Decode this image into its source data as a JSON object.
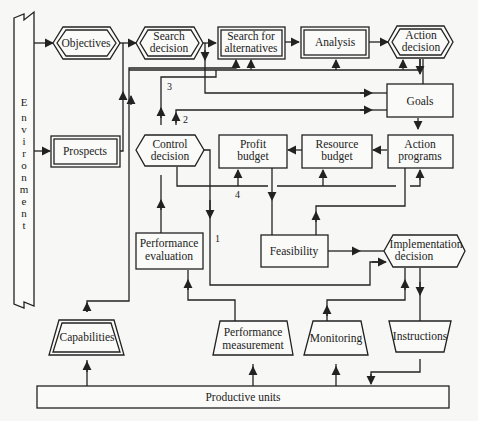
{
  "diagram": {
    "type": "flowchart",
    "environment": {
      "label": "Environment",
      "letters": [
        "E",
        "n",
        "v",
        "i",
        "r",
        "o",
        "n",
        "m",
        "e",
        "n",
        "t"
      ]
    },
    "nodes": {
      "objectives": {
        "line1": "Objectives",
        "shape": "double-hexagon"
      },
      "search_decision": {
        "line1": "Search",
        "line2": "decision",
        "shape": "double-hexagon"
      },
      "search_alternatives": {
        "line1": "Search for",
        "line2": "alternatives",
        "shape": "double-rectangle"
      },
      "analysis": {
        "line1": "Analysis",
        "shape": "double-rectangle"
      },
      "action_decision": {
        "line1": "Action",
        "line2": "decision",
        "shape": "double-hexagon"
      },
      "goals": {
        "line1": "Goals",
        "shape": "rectangle"
      },
      "prospects": {
        "line1": "Prospects",
        "shape": "double-rectangle"
      },
      "control_decision": {
        "line1": "Control",
        "line2": "decision",
        "shape": "hexagon"
      },
      "profit_budget": {
        "line1": "Profit",
        "line2": "budget",
        "shape": "rectangle"
      },
      "resource_budget": {
        "line1": "Resource",
        "line2": "budget",
        "shape": "rectangle"
      },
      "action_programs": {
        "line1": "Action",
        "line2": "programs",
        "shape": "rectangle"
      },
      "performance_evaluation": {
        "line1": "Performance",
        "line2": "evaluation",
        "shape": "rectangle"
      },
      "feasibility": {
        "line1": "Feasibility",
        "shape": "rectangle"
      },
      "implementation_decision": {
        "line1": "Implementation",
        "line2": "decision",
        "shape": "hexagon"
      },
      "capabilities": {
        "line1": "Capabilities",
        "shape": "double-trapezoid"
      },
      "performance_measurement": {
        "line1": "Performance",
        "line2": "measurement",
        "shape": "trapezoid"
      },
      "monitoring": {
        "line1": "Monitoring",
        "shape": "trapezoid"
      },
      "instructions": {
        "line1": "Instructions",
        "shape": "inverted-trapezoid"
      },
      "productive_units": {
        "line1": "Productive units",
        "shape": "rectangle"
      }
    },
    "loop_labels": {
      "one": "1",
      "two": "2",
      "three": "3",
      "four": "4"
    },
    "edges": [
      {
        "from": "Environment",
        "to": "Objectives"
      },
      {
        "from": "Environment",
        "to": "Prospects"
      },
      {
        "from": "Objectives",
        "to": "Search decision"
      },
      {
        "from": "Prospects",
        "to": "Search decision"
      },
      {
        "from": "Search decision",
        "to": "Search for alternatives"
      },
      {
        "from": "Search decision",
        "to": "Goals"
      },
      {
        "from": "Search for alternatives",
        "to": "Analysis"
      },
      {
        "from": "Analysis",
        "to": "Action decision"
      },
      {
        "from": "Action decision",
        "to": "Goals"
      },
      {
        "from": "Goals",
        "to": "Action programs"
      },
      {
        "from": "Action programs",
        "to": "Resource budget"
      },
      {
        "from": "Resource budget",
        "to": "Profit budget"
      },
      {
        "from": "Profit budget",
        "to": "Feasibility"
      },
      {
        "from": "Feasibility",
        "to": "Action programs"
      },
      {
        "from": "Feasibility",
        "to": "Implementation decision"
      },
      {
        "from": "Control decision",
        "to": "Search for alternatives",
        "label": "3"
      },
      {
        "from": "Control decision",
        "to": "Goals",
        "label": "2"
      },
      {
        "from": "Control decision",
        "to": "Profit budget / Resource budget / Action programs",
        "label": "4"
      },
      {
        "from": "Control decision",
        "to": "Implementation decision",
        "label": "1"
      },
      {
        "from": "Performance evaluation",
        "to": "Control decision"
      },
      {
        "from": "Capabilities",
        "to": "Search for alternatives / Analysis / Action decision"
      },
      {
        "from": "Performance measurement",
        "to": "Performance evaluation"
      },
      {
        "from": "Monitoring",
        "to": "Implementation decision"
      },
      {
        "from": "Implementation decision",
        "to": "Instructions"
      },
      {
        "from": "Instructions",
        "to": "Productive units"
      },
      {
        "from": "Productive units",
        "to": "Capabilities"
      },
      {
        "from": "Productive units",
        "to": "Performance measurement"
      },
      {
        "from": "Productive units",
        "to": "Monitoring"
      }
    ]
  }
}
